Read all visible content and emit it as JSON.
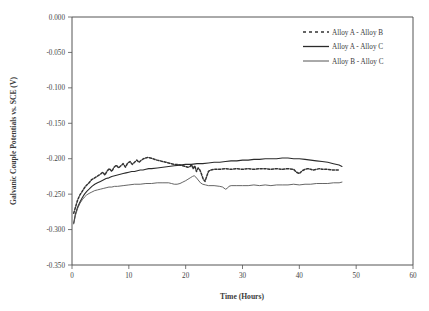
{
  "chart_data": {
    "type": "line",
    "title": "",
    "xlabel": "Time (Hours)",
    "ylabel": "Galvanic Couple Potentials vs. SCE (V)",
    "xlim": [
      0,
      60
    ],
    "ylim": [
      -0.35,
      0.0
    ],
    "xticks": [
      0,
      10,
      20,
      30,
      40,
      50,
      60
    ],
    "xtick_labels": [
      "0",
      "10",
      "20",
      "30",
      "40",
      "50",
      "60"
    ],
    "yticks": [
      0.0,
      -0.05,
      -0.1,
      -0.15,
      -0.2,
      -0.25,
      -0.3,
      -0.35
    ],
    "ytick_labels": [
      "0.000",
      "-0.050",
      "-0.100",
      "-0.150",
      "-0.200",
      "-0.250",
      "-0.300",
      "-0.350"
    ],
    "grid": false,
    "legend_position": "top-right",
    "series": [
      {
        "name": "Alloy A - Alloy B",
        "style": "dashed",
        "color": "#333333",
        "x": [
          0.3,
          0.7,
          1.0,
          1.4,
          1.8,
          2.2,
          2.6,
          3.0,
          3.4,
          3.8,
          4.2,
          4.6,
          5.0,
          5.4,
          5.8,
          6.2,
          6.6,
          7.0,
          7.4,
          7.8,
          8.2,
          8.6,
          9.0,
          9.4,
          9.8,
          10.2,
          10.6,
          11.0,
          11.4,
          11.8,
          12.2,
          12.6,
          13.0,
          13.4,
          13.8,
          14.2,
          14.6,
          15.0,
          15.5,
          16.0,
          16.5,
          17.0,
          17.5,
          18.0,
          18.5,
          19.0,
          19.5,
          20.0,
          20.4,
          20.8,
          21.0,
          21.3,
          21.6,
          21.9,
          22.2,
          22.5,
          22.8,
          23.1,
          23.4,
          23.7,
          24.0,
          24.4,
          25.0,
          26.0,
          27.0,
          28.0,
          29.0,
          30.0,
          31.0,
          32.0,
          33.0,
          34.0,
          35.0,
          36.0,
          37.0,
          38.0,
          39.0,
          39.5,
          40.0,
          40.5,
          41.0,
          41.5,
          42.0,
          42.5,
          43.0,
          43.5,
          44.0,
          45.0,
          46.0,
          47.0
        ],
        "y": [
          -0.277,
          -0.266,
          -0.258,
          -0.251,
          -0.246,
          -0.241,
          -0.237,
          -0.234,
          -0.23,
          -0.228,
          -0.226,
          -0.224,
          -0.222,
          -0.219,
          -0.223,
          -0.217,
          -0.214,
          -0.218,
          -0.212,
          -0.209,
          -0.213,
          -0.21,
          -0.207,
          -0.212,
          -0.206,
          -0.204,
          -0.208,
          -0.205,
          -0.202,
          -0.205,
          -0.202,
          -0.2,
          -0.199,
          -0.198,
          -0.199,
          -0.2,
          -0.201,
          -0.202,
          -0.203,
          -0.204,
          -0.205,
          -0.206,
          -0.207,
          -0.208,
          -0.208,
          -0.209,
          -0.21,
          -0.211,
          -0.212,
          -0.211,
          -0.208,
          -0.214,
          -0.21,
          -0.218,
          -0.213,
          -0.216,
          -0.222,
          -0.229,
          -0.232,
          -0.225,
          -0.218,
          -0.216,
          -0.215,
          -0.215,
          -0.214,
          -0.215,
          -0.214,
          -0.215,
          -0.214,
          -0.215,
          -0.214,
          -0.214,
          -0.215,
          -0.214,
          -0.215,
          -0.214,
          -0.215,
          -0.219,
          -0.221,
          -0.217,
          -0.215,
          -0.214,
          -0.215,
          -0.216,
          -0.215,
          -0.214,
          -0.215,
          -0.215,
          -0.216,
          -0.216
        ]
      },
      {
        "name": "Alloy A - Alloy C",
        "style": "solid",
        "color": "#2b2b2b",
        "x": [
          0.3,
          0.6,
          1.0,
          1.4,
          1.8,
          2.2,
          2.6,
          3.0,
          3.5,
          4.0,
          4.5,
          5.0,
          5.5,
          6.0,
          6.5,
          7.0,
          7.5,
          8.0,
          8.5,
          9.0,
          9.5,
          10.0,
          10.5,
          11.0,
          11.5,
          12.0,
          12.5,
          13.0,
          13.5,
          14.0,
          15.0,
          16.0,
          17.0,
          18.0,
          19.0,
          20.0,
          21.0,
          22.0,
          23.0,
          24.0,
          25.0,
          26.0,
          27.0,
          28.0,
          29.0,
          30.0,
          31.0,
          32.0,
          33.0,
          34.0,
          35.0,
          36.0,
          37.0,
          38.0,
          39.0,
          40.0,
          41.0,
          42.0,
          43.0,
          44.0,
          45.0,
          46.0,
          47.0,
          47.5
        ],
        "y": [
          -0.291,
          -0.278,
          -0.268,
          -0.261,
          -0.255,
          -0.25,
          -0.246,
          -0.243,
          -0.239,
          -0.236,
          -0.234,
          -0.232,
          -0.23,
          -0.228,
          -0.227,
          -0.225,
          -0.224,
          -0.223,
          -0.222,
          -0.221,
          -0.22,
          -0.219,
          -0.218,
          -0.218,
          -0.217,
          -0.216,
          -0.216,
          -0.215,
          -0.214,
          -0.214,
          -0.213,
          -0.212,
          -0.211,
          -0.21,
          -0.209,
          -0.208,
          -0.208,
          -0.207,
          -0.207,
          -0.206,
          -0.205,
          -0.205,
          -0.204,
          -0.203,
          -0.203,
          -0.202,
          -0.202,
          -0.201,
          -0.201,
          -0.2,
          -0.2,
          -0.2,
          -0.199,
          -0.199,
          -0.2,
          -0.2,
          -0.201,
          -0.202,
          -0.203,
          -0.204,
          -0.205,
          -0.207,
          -0.209,
          -0.211
        ]
      },
      {
        "name": "Alloy B - Alloy C",
        "style": "solid",
        "color": "#555555",
        "x": [
          0.3,
          0.6,
          1.0,
          1.4,
          1.8,
          2.2,
          2.6,
          3.0,
          3.5,
          4.0,
          4.5,
          5.0,
          5.5,
          6.0,
          6.5,
          7.0,
          7.5,
          8.0,
          9.0,
          10.0,
          11.0,
          12.0,
          13.0,
          14.0,
          15.0,
          16.0,
          17.0,
          17.5,
          18.0,
          18.5,
          19.0,
          19.5,
          20.0,
          20.4,
          20.8,
          21.2,
          21.5,
          21.8,
          22.2,
          22.6,
          23.0,
          23.5,
          24.0,
          25.0,
          26.0,
          26.5,
          27.0,
          27.3,
          27.6,
          28.0,
          29.0,
          30.0,
          31.0,
          32.0,
          33.0,
          34.0,
          35.0,
          36.0,
          37.0,
          38.0,
          39.0,
          40.0,
          41.0,
          42.0,
          43.0,
          44.0,
          45.0,
          46.0,
          47.0,
          47.5
        ],
        "y": [
          -0.292,
          -0.28,
          -0.27,
          -0.263,
          -0.258,
          -0.254,
          -0.251,
          -0.249,
          -0.247,
          -0.245,
          -0.244,
          -0.243,
          -0.242,
          -0.241,
          -0.24,
          -0.24,
          -0.239,
          -0.239,
          -0.238,
          -0.237,
          -0.236,
          -0.236,
          -0.235,
          -0.235,
          -0.234,
          -0.234,
          -0.234,
          -0.235,
          -0.236,
          -0.236,
          -0.235,
          -0.233,
          -0.231,
          -0.229,
          -0.227,
          -0.225,
          -0.224,
          -0.226,
          -0.23,
          -0.234,
          -0.236,
          -0.237,
          -0.238,
          -0.238,
          -0.239,
          -0.24,
          -0.243,
          -0.242,
          -0.239,
          -0.238,
          -0.238,
          -0.238,
          -0.238,
          -0.237,
          -0.238,
          -0.237,
          -0.238,
          -0.237,
          -0.237,
          -0.237,
          -0.236,
          -0.237,
          -0.236,
          -0.236,
          -0.235,
          -0.235,
          -0.235,
          -0.234,
          -0.234,
          -0.233
        ]
      }
    ]
  },
  "legend": {
    "items": [
      {
        "label": "Alloy A - Alloy B"
      },
      {
        "label": "Alloy A - Alloy C"
      },
      {
        "label": "Alloy B - Alloy C"
      }
    ]
  }
}
